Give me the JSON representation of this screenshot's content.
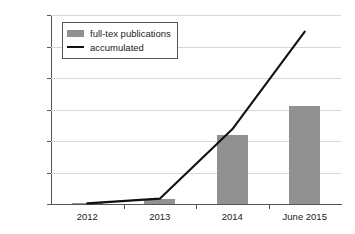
{
  "chart_data": {
    "type": "bar",
    "title": "",
    "subtitle": "",
    "xlabel": "",
    "ylabel": "",
    "categories": [
      "2012",
      "2013",
      "2014",
      "June 2015"
    ],
    "series": [
      {
        "name": "full-tex publications",
        "type": "bar",
        "color": "#919191",
        "values": [
          2000,
          15000,
          220000,
          310000
        ]
      },
      {
        "name": "accumulated",
        "type": "line",
        "color": "#111111",
        "values": [
          2000,
          17000,
          237000,
          547000
        ]
      }
    ],
    "ylim": [
      0,
      600000
    ],
    "ytick_values": [
      0,
      100000,
      200000,
      300000,
      400000,
      500000,
      600000
    ],
    "ytick_labels": [
      "0",
      "100,000",
      "200,000",
      "300,000",
      "400,000",
      "500,000",
      "600,000"
    ],
    "grid": "horizontal",
    "grid_color": "#d8d8d8",
    "legend_position": "top-left-inside",
    "legend_entries": [
      {
        "label": "full-tex publications",
        "marker": "bar-swatch",
        "color": "#919191"
      },
      {
        "label": "accumulated",
        "marker": "line-swatch",
        "color": "#111111"
      }
    ],
    "axis_color": "#555555",
    "background": "#ffffff"
  }
}
